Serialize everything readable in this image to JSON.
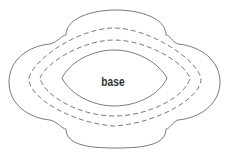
{
  "diagram": {
    "center_label": "base",
    "layers": [
      {
        "name": "outer-scalloped-boundary",
        "style": "solid"
      },
      {
        "name": "outer-dashed-ring",
        "style": "dashed"
      },
      {
        "name": "inner-dashed-ring",
        "style": "dashed"
      },
      {
        "name": "base-boundary",
        "style": "solid"
      }
    ],
    "colors": {
      "stroke": "#7a7a7a",
      "text": "#333333",
      "background": "#ffffff"
    }
  }
}
